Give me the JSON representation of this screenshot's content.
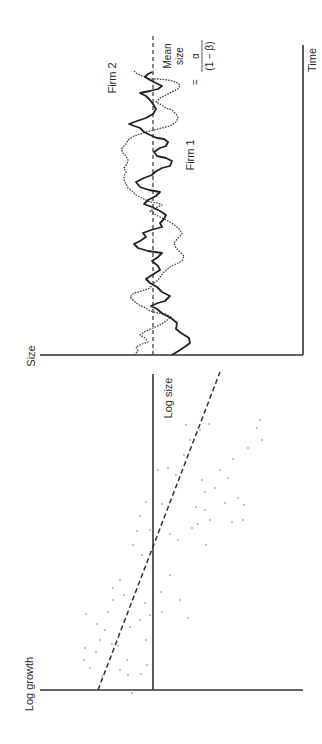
{
  "chart_data": [
    {
      "panel": "left",
      "type": "scatter",
      "orientation": "rotated 90° counter-clockwise",
      "title": "",
      "xlabel": "Log size",
      "ylabel": "Log growth",
      "grid": false,
      "legend": null,
      "annotations": [],
      "series": [
        {
          "name": "firms",
          "kind": "scatter",
          "description": "Cloud of firm observations of log growth vs log size"
        },
        {
          "name": "fitted regression",
          "kind": "line",
          "style": "dashed",
          "slope_sign": "negative",
          "description": "Dashed fitted line: higher log growth at smaller log size, crossing zero growth near the middle of the size range"
        }
      ],
      "axes": {
        "x_axis_at": "log growth = 0 (horizontal axis through the middle)",
        "y_axis_at": "left edge"
      }
    },
    {
      "panel": "right",
      "type": "line",
      "orientation": "rotated 90° counter-clockwise",
      "title": "",
      "xlabel": "Time",
      "ylabel": "Size",
      "grid": false,
      "legend": null,
      "series": [
        {
          "name": "Firm 1",
          "style": "solid",
          "description": "Solid line fluctuating around the mean size"
        },
        {
          "name": "Firm 2",
          "style": "dotted",
          "description": "Dotted line fluctuating around the mean size"
        },
        {
          "name": "Mean size",
          "style": "dashed",
          "description": "Horizontal dashed line at mean size = α/(1 − β)"
        }
      ],
      "annotations": [
        "Firm 1",
        "Firm 2",
        "Mean size = α/(1 − β)"
      ]
    }
  ],
  "labels": {
    "log_growth": "Log growth",
    "log_size": "Log size",
    "size": "Size",
    "time": "Time",
    "firm1": "Firm 1",
    "firm2": "Firm 2",
    "mean": "Mean",
    "size_word": "size",
    "equals": "=",
    "alpha": "α",
    "one_minus_beta": "(1 − β)"
  },
  "geometry": {
    "firm1_points": [
      [
        172,
        355
      ],
      [
        180,
        350
      ],
      [
        186,
        346
      ],
      [
        190,
        343
      ],
      [
        189,
        338
      ],
      [
        181,
        333
      ],
      [
        176,
        329
      ],
      [
        177,
        323
      ],
      [
        171,
        318
      ],
      [
        163,
        314
      ],
      [
        157,
        309
      ],
      [
        151,
        306
      ],
      [
        158,
        303
      ],
      [
        165,
        301
      ],
      [
        170,
        296
      ],
      [
        162,
        292
      ],
      [
        157,
        287
      ],
      [
        150,
        283
      ],
      [
        146,
        279
      ],
      [
        152,
        275
      ],
      [
        160,
        270
      ],
      [
        158,
        266
      ],
      [
        152,
        261
      ],
      [
        158,
        257
      ],
      [
        162,
        253
      ],
      [
        148,
        251
      ],
      [
        138,
        248
      ],
      [
        134,
        244
      ],
      [
        140,
        241
      ],
      [
        146,
        237
      ],
      [
        143,
        233
      ],
      [
        151,
        230
      ],
      [
        162,
        227
      ],
      [
        160,
        223
      ],
      [
        164,
        219
      ],
      [
        166,
        215
      ],
      [
        160,
        211
      ],
      [
        152,
        207
      ],
      [
        144,
        204
      ],
      [
        148,
        200
      ],
      [
        156,
        196
      ],
      [
        160,
        192
      ],
      [
        149,
        190
      ],
      [
        140,
        187
      ],
      [
        136,
        182
      ],
      [
        144,
        178
      ],
      [
        152,
        175
      ],
      [
        155,
        172
      ],
      [
        162,
        168
      ],
      [
        170,
        166
      ],
      [
        172,
        161
      ],
      [
        166,
        158
      ],
      [
        157,
        156
      ],
      [
        154,
        152
      ],
      [
        160,
        148
      ],
      [
        166,
        146
      ],
      [
        168,
        142
      ],
      [
        164,
        139
      ],
      [
        157,
        138
      ],
      [
        150,
        135
      ],
      [
        144,
        132
      ],
      [
        140,
        128
      ],
      [
        129,
        124
      ],
      [
        137,
        121
      ],
      [
        146,
        118
      ],
      [
        153,
        114
      ],
      [
        156,
        109
      ],
      [
        153,
        104
      ],
      [
        150,
        100
      ],
      [
        146,
        96
      ],
      [
        140,
        93
      ],
      [
        150,
        91
      ],
      [
        158,
        89
      ],
      [
        162,
        86
      ],
      [
        156,
        83
      ],
      [
        150,
        80
      ],
      [
        145,
        77
      ],
      [
        148,
        74
      ],
      [
        152,
        72
      ]
    ],
    "firm2_points": [
      [
        134,
        355
      ],
      [
        138,
        351
      ],
      [
        136,
        347
      ],
      [
        142,
        344
      ],
      [
        148,
        342
      ],
      [
        145,
        338
      ],
      [
        140,
        335
      ],
      [
        146,
        331
      ],
      [
        153,
        328
      ],
      [
        160,
        325
      ],
      [
        166,
        321
      ],
      [
        171,
        317
      ],
      [
        166,
        314
      ],
      [
        158,
        313
      ],
      [
        150,
        311
      ],
      [
        146,
        308
      ],
      [
        139,
        305
      ],
      [
        134,
        301
      ],
      [
        130,
        297
      ],
      [
        134,
        293
      ],
      [
        142,
        291
      ],
      [
        150,
        288
      ],
      [
        153,
        284
      ],
      [
        158,
        280
      ],
      [
        161,
        276
      ],
      [
        164,
        272
      ],
      [
        170,
        267
      ],
      [
        176,
        264
      ],
      [
        182,
        261
      ],
      [
        184,
        256
      ],
      [
        180,
        252
      ],
      [
        176,
        248
      ],
      [
        174,
        243
      ],
      [
        178,
        238
      ],
      [
        182,
        234
      ],
      [
        180,
        230
      ],
      [
        176,
        226
      ],
      [
        170,
        222
      ],
      [
        164,
        219
      ],
      [
        158,
        216
      ],
      [
        153,
        213
      ],
      [
        150,
        211
      ],
      [
        156,
        208
      ],
      [
        162,
        205
      ],
      [
        158,
        203
      ],
      [
        150,
        202
      ],
      [
        142,
        198
      ],
      [
        136,
        195
      ],
      [
        132,
        191
      ],
      [
        128,
        188
      ],
      [
        126,
        184
      ],
      [
        124,
        180
      ],
      [
        124,
        176
      ],
      [
        126,
        172
      ],
      [
        124,
        168
      ],
      [
        127,
        164
      ],
      [
        128,
        160
      ],
      [
        126,
        156
      ],
      [
        122,
        152
      ],
      [
        122,
        148
      ],
      [
        126,
        144
      ],
      [
        128,
        140
      ],
      [
        134,
        136
      ],
      [
        140,
        134
      ],
      [
        146,
        132
      ],
      [
        154,
        130
      ],
      [
        162,
        128
      ],
      [
        170,
        126
      ],
      [
        176,
        122
      ],
      [
        178,
        118
      ],
      [
        176,
        114
      ],
      [
        172,
        110
      ],
      [
        166,
        108
      ],
      [
        160,
        104
      ],
      [
        156,
        102
      ],
      [
        160,
        98
      ],
      [
        166,
        95
      ],
      [
        172,
        92
      ],
      [
        178,
        89
      ],
      [
        180,
        85
      ],
      [
        176,
        82
      ],
      [
        168,
        80
      ],
      [
        158,
        79
      ],
      [
        150,
        79
      ],
      [
        146,
        77
      ],
      [
        140,
        75
      ],
      [
        136,
        73
      ],
      [
        134,
        71
      ]
    ],
    "dots": [
      [
        260,
        420
      ],
      [
        257,
        428
      ],
      [
        248,
        448
      ],
      [
        262,
        440
      ],
      [
        233,
        459
      ],
      [
        220,
        470
      ],
      [
        228,
        478
      ],
      [
        215,
        488
      ],
      [
        225,
        503
      ],
      [
        232,
        522
      ],
      [
        243,
        520
      ],
      [
        244,
        505
      ],
      [
        205,
        492
      ],
      [
        196,
        507
      ],
      [
        202,
        480
      ],
      [
        184,
        455
      ],
      [
        176,
        475
      ],
      [
        168,
        468
      ],
      [
        186,
        425
      ],
      [
        190,
        440
      ],
      [
        200,
        430
      ],
      [
        209,
        424
      ],
      [
        238,
        498
      ],
      [
        210,
        520
      ],
      [
        198,
        524
      ],
      [
        192,
        528
      ],
      [
        206,
        545
      ],
      [
        178,
        540
      ],
      [
        170,
        575
      ],
      [
        180,
        600
      ],
      [
        188,
        618
      ],
      [
        205,
        510
      ],
      [
        170,
        534
      ],
      [
        158,
        470
      ],
      [
        162,
        504
      ],
      [
        146,
        502
      ],
      [
        140,
        516
      ],
      [
        150,
        530
      ],
      [
        133,
        545
      ],
      [
        137,
        531
      ],
      [
        142,
        555
      ],
      [
        120,
        580
      ],
      [
        124,
        595
      ],
      [
        113,
        600
      ],
      [
        105,
        630
      ],
      [
        108,
        612
      ],
      [
        100,
        640
      ],
      [
        96,
        652
      ],
      [
        90,
        668
      ],
      [
        84,
        660
      ],
      [
        85,
        648
      ],
      [
        97,
        624
      ],
      [
        118,
        646
      ],
      [
        120,
        670
      ],
      [
        128,
        675
      ],
      [
        127,
        660
      ],
      [
        141,
        674
      ],
      [
        153,
        600
      ],
      [
        145,
        603
      ],
      [
        140,
        620
      ],
      [
        150,
        615
      ],
      [
        146,
        640
      ],
      [
        147,
        665
      ],
      [
        162,
        612
      ],
      [
        161,
        592
      ],
      [
        130,
        627
      ],
      [
        113,
        588
      ],
      [
        112,
        644
      ],
      [
        86,
        614
      ],
      [
        102,
        676
      ],
      [
        132,
        693
      ]
    ]
  }
}
